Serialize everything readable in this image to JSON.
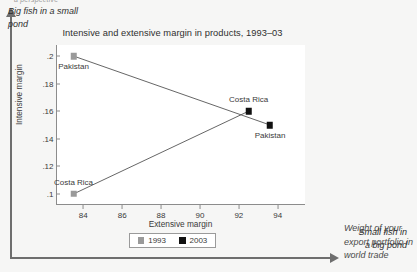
{
  "outer": {
    "ylabel_clipped": "a perspective",
    "xlabel": "Weight of your export portfolio in world trade",
    "y_arrow_icon": "arrow-up-icon",
    "x_arrow_icon": "arrow-right-icon"
  },
  "chart_data": {
    "type": "scatter",
    "title": "Intensive and extensive margin in products, 1993–03",
    "xlabel": "Extensive margin",
    "ylabel": "Intensive margin",
    "xlim": [
      82.6,
      95.4
    ],
    "ylim": [
      0.092,
      0.208
    ],
    "xticks": [
      84,
      86,
      88,
      90,
      92,
      94
    ],
    "xtick_labels": [
      "84",
      "86",
      "88",
      "90",
      "92",
      "94"
    ],
    "yticks": [
      0.1,
      0.12,
      0.14,
      0.16,
      0.18,
      0.2
    ],
    "ytick_labels": [
      ".1",
      ".12",
      ".14",
      ".16",
      ".18",
      ".2"
    ],
    "grid": false,
    "legend_position": "bottom-center",
    "series": [
      {
        "name": "1993",
        "color": "#9a9a9a",
        "marker": "square"
      },
      {
        "name": "2003",
        "color": "#111111",
        "marker": "square"
      }
    ],
    "points": [
      {
        "country": "Pakistan",
        "year": "1993",
        "x": 83.5,
        "y": 0.2,
        "series": 0,
        "label": "Pakistan",
        "label_pos": "below"
      },
      {
        "country": "Pakistan",
        "year": "2003",
        "x": 93.6,
        "y": 0.15,
        "series": 1,
        "label": "Pakistan",
        "label_pos": "below"
      },
      {
        "country": "Costa Rica",
        "year": "1993",
        "x": 83.5,
        "y": 0.1,
        "series": 0,
        "label": "Costa Rica",
        "label_pos": "above"
      },
      {
        "country": "Costa Rica",
        "year": "2003",
        "x": 92.5,
        "y": 0.16,
        "series": 1,
        "label": "Costa Rica",
        "label_pos": "above"
      }
    ],
    "connectors": [
      {
        "country": "Pakistan",
        "from": [
          83.5,
          0.2
        ],
        "to": [
          93.6,
          0.15
        ]
      },
      {
        "country": "Costa Rica",
        "from": [
          83.5,
          0.1
        ],
        "to": [
          92.5,
          0.16
        ]
      }
    ],
    "annotations": [
      {
        "id": "big",
        "text_line1": "Big fish in a small",
        "text_line2": "pond"
      },
      {
        "id": "small",
        "text_line1": "Small fish in",
        "text_line2": "a big pond"
      }
    ]
  }
}
